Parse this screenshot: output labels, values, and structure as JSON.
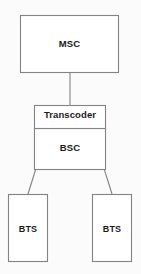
{
  "diagram": {
    "type": "block-hierarchy",
    "canvas": {
      "width": 141,
      "height": 274
    },
    "style": {
      "background_color": "#fbfbfb",
      "stroke_color": "#838383",
      "box_fill_color": "#ffffff",
      "text_color": "#1b1b1b"
    },
    "nodes": [
      {
        "id": "msc",
        "label": "MSC",
        "shape": "rectangle",
        "x": 20,
        "y": 15,
        "width": 99,
        "height": 58
      },
      {
        "id": "transcoder",
        "label": "Transcoder",
        "shape": "rectangle",
        "x": 34,
        "y": 105,
        "width": 72,
        "height": 23
      },
      {
        "id": "bsc",
        "label": "BSC",
        "shape": "rectangle",
        "x": 34,
        "y": 128,
        "width": 72,
        "height": 42
      },
      {
        "id": "bts-left",
        "label": "BTS",
        "shape": "rectangle",
        "x": 8,
        "y": 194,
        "width": 40,
        "height": 68
      },
      {
        "id": "bts-right",
        "label": "BTS",
        "shape": "rectangle",
        "x": 92,
        "y": 194,
        "width": 40,
        "height": 68
      }
    ],
    "edges": [
      {
        "id": "msc-to-transcoder",
        "from": "msc",
        "to": "transcoder",
        "kind": "vertical"
      },
      {
        "id": "transcoder-to-bts-left",
        "from": "transcoder",
        "to": "bts-left",
        "kind": "diagonal"
      },
      {
        "id": "transcoder-to-bts-right",
        "from": "transcoder",
        "to": "bts-right",
        "kind": "diagonal"
      }
    ]
  }
}
